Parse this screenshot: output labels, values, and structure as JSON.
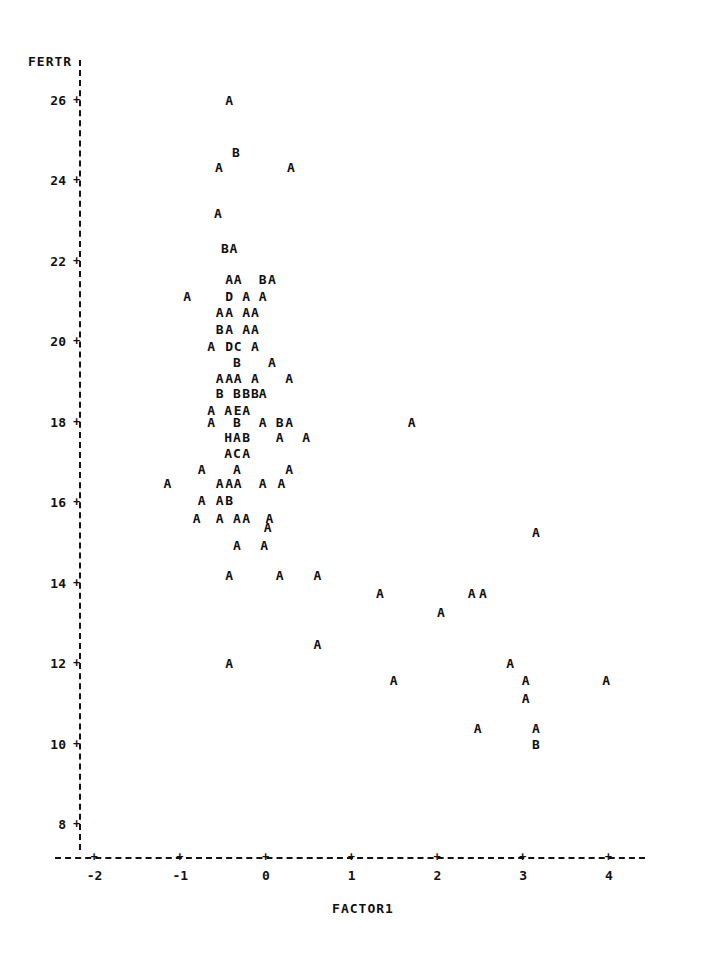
{
  "chart_data": {
    "type": "scatter",
    "title": "",
    "xlabel": "FACTOR1",
    "ylabel": "FERTR",
    "grid": false,
    "legend": null,
    "axis_style": "dashed-ascii",
    "tick_glyph": "+",
    "xlim": [
      -2.25,
      4.35
    ],
    "ylim": [
      7.3,
      26.9
    ],
    "xticks": [
      -2,
      -1,
      0,
      1,
      2,
      3,
      4
    ],
    "xtick_labels": [
      "-2",
      "-1",
      "0",
      "1",
      "2",
      "3",
      "4"
    ],
    "yticks": [
      26,
      24,
      22,
      20,
      18,
      16,
      14,
      12,
      10,
      8
    ],
    "ytick_labels": [
      "26",
      "24",
      "22",
      "20",
      "18",
      "16",
      "14",
      "12",
      "10",
      "8"
    ],
    "point_labels_meaning": "letter denotes count of overlapping observations: A=1, B=2, C=3, D=4, E=5, H=8",
    "points": [
      {
        "label": "A",
        "x": -0.43,
        "y": 26.0
      },
      {
        "label": "B",
        "x": -0.35,
        "y": 24.7
      },
      {
        "label": "A",
        "x": -0.55,
        "y": 24.33
      },
      {
        "label": "A",
        "x": 0.29,
        "y": 24.33
      },
      {
        "label": "A",
        "x": -0.56,
        "y": 23.17
      },
      {
        "label": "B",
        "x": -0.48,
        "y": 22.3
      },
      {
        "label": "A",
        "x": -0.38,
        "y": 22.3
      },
      {
        "label": "A",
        "x": -0.43,
        "y": 21.53
      },
      {
        "label": "A",
        "x": -0.33,
        "y": 21.53
      },
      {
        "label": "B",
        "x": -0.04,
        "y": 21.53
      },
      {
        "label": "A",
        "x": 0.07,
        "y": 21.53
      },
      {
        "label": "A",
        "x": -0.92,
        "y": 21.13
      },
      {
        "label": "D",
        "x": -0.43,
        "y": 21.13
      },
      {
        "label": "A",
        "x": -0.23,
        "y": 21.13
      },
      {
        "label": "A",
        "x": -0.04,
        "y": 21.13
      },
      {
        "label": "A",
        "x": -0.54,
        "y": 20.72
      },
      {
        "label": "A",
        "x": -0.43,
        "y": 20.72
      },
      {
        "label": "A",
        "x": -0.23,
        "y": 20.72
      },
      {
        "label": "A",
        "x": -0.13,
        "y": 20.72
      },
      {
        "label": "B",
        "x": -0.54,
        "y": 20.3
      },
      {
        "label": "A",
        "x": -0.43,
        "y": 20.3
      },
      {
        "label": "A",
        "x": -0.23,
        "y": 20.3
      },
      {
        "label": "A",
        "x": -0.13,
        "y": 20.3
      },
      {
        "label": "A",
        "x": -0.64,
        "y": 19.88
      },
      {
        "label": "D",
        "x": -0.43,
        "y": 19.88
      },
      {
        "label": "C",
        "x": -0.33,
        "y": 19.88
      },
      {
        "label": "A",
        "x": -0.13,
        "y": 19.88
      },
      {
        "label": "B",
        "x": -0.34,
        "y": 19.48
      },
      {
        "label": "A",
        "x": 0.07,
        "y": 19.48
      },
      {
        "label": "A",
        "x": -0.54,
        "y": 19.09
      },
      {
        "label": "A",
        "x": -0.43,
        "y": 19.09
      },
      {
        "label": "A",
        "x": -0.33,
        "y": 19.09
      },
      {
        "label": "A",
        "x": -0.13,
        "y": 19.09
      },
      {
        "label": "A",
        "x": 0.27,
        "y": 19.09
      },
      {
        "label": "B",
        "x": -0.54,
        "y": 18.7
      },
      {
        "label": "B",
        "x": -0.34,
        "y": 18.7
      },
      {
        "label": "B",
        "x": -0.23,
        "y": 18.7
      },
      {
        "label": "B",
        "x": -0.13,
        "y": 18.7
      },
      {
        "label": "A",
        "x": -0.04,
        "y": 18.7
      },
      {
        "label": "A",
        "x": -0.64,
        "y": 18.29
      },
      {
        "label": "A",
        "x": -0.44,
        "y": 18.29
      },
      {
        "label": "E",
        "x": -0.33,
        "y": 18.29
      },
      {
        "label": "A",
        "x": -0.23,
        "y": 18.29
      },
      {
        "label": "A",
        "x": -0.64,
        "y": 18.0
      },
      {
        "label": "B",
        "x": -0.34,
        "y": 18.0
      },
      {
        "label": "A",
        "x": -0.04,
        "y": 18.0
      },
      {
        "label": "B",
        "x": 0.16,
        "y": 18.0
      },
      {
        "label": "A",
        "x": 0.27,
        "y": 18.0
      },
      {
        "label": "A",
        "x": 1.7,
        "y": 18.0
      },
      {
        "label": "H",
        "x": -0.44,
        "y": 17.61
      },
      {
        "label": "A",
        "x": -0.34,
        "y": 17.61
      },
      {
        "label": "B",
        "x": -0.23,
        "y": 17.61
      },
      {
        "label": "A",
        "x": 0.16,
        "y": 17.61
      },
      {
        "label": "A",
        "x": 0.47,
        "y": 17.61
      },
      {
        "label": "A",
        "x": -0.44,
        "y": 17.22
      },
      {
        "label": "C",
        "x": -0.34,
        "y": 17.22
      },
      {
        "label": "A",
        "x": -0.23,
        "y": 17.22
      },
      {
        "label": "A",
        "x": -0.75,
        "y": 16.83
      },
      {
        "label": "A",
        "x": -0.34,
        "y": 16.83
      },
      {
        "label": "A",
        "x": 0.27,
        "y": 16.83
      },
      {
        "label": "A",
        "x": -1.15,
        "y": 16.46
      },
      {
        "label": "A",
        "x": -0.54,
        "y": 16.46
      },
      {
        "label": "A",
        "x": -0.43,
        "y": 16.46
      },
      {
        "label": "A",
        "x": -0.33,
        "y": 16.46
      },
      {
        "label": "A",
        "x": -0.04,
        "y": 16.46
      },
      {
        "label": "A",
        "x": 0.18,
        "y": 16.46
      },
      {
        "label": "A",
        "x": -0.75,
        "y": 16.05
      },
      {
        "label": "A",
        "x": -0.54,
        "y": 16.05
      },
      {
        "label": "B",
        "x": -0.43,
        "y": 16.05
      },
      {
        "label": "A",
        "x": -0.81,
        "y": 15.61
      },
      {
        "label": "A",
        "x": -0.54,
        "y": 15.61
      },
      {
        "label": "A",
        "x": -0.34,
        "y": 15.61
      },
      {
        "label": "A",
        "x": -0.23,
        "y": 15.61
      },
      {
        "label": "A",
        "x": 0.04,
        "y": 15.61
      },
      {
        "label": "A",
        "x": 0.02,
        "y": 15.39
      },
      {
        "label": "A",
        "x": -0.34,
        "y": 14.93
      },
      {
        "label": "A",
        "x": -0.02,
        "y": 14.93
      },
      {
        "label": "A",
        "x": 3.15,
        "y": 15.25
      },
      {
        "label": "A",
        "x": -0.43,
        "y": 14.19
      },
      {
        "label": "A",
        "x": 0.16,
        "y": 14.19
      },
      {
        "label": "A",
        "x": 0.6,
        "y": 14.19
      },
      {
        "label": "A",
        "x": 1.33,
        "y": 13.74
      },
      {
        "label": "A",
        "x": 2.04,
        "y": 13.26
      },
      {
        "label": "A",
        "x": 2.4,
        "y": 13.74
      },
      {
        "label": "A",
        "x": 2.53,
        "y": 13.74
      },
      {
        "label": "A",
        "x": 0.6,
        "y": 12.46
      },
      {
        "label": "A",
        "x": -0.43,
        "y": 12.0
      },
      {
        "label": "A",
        "x": 1.49,
        "y": 11.58
      },
      {
        "label": "A",
        "x": 2.85,
        "y": 12.0
      },
      {
        "label": "A",
        "x": 3.03,
        "y": 11.58
      },
      {
        "label": "A",
        "x": 3.97,
        "y": 11.58
      },
      {
        "label": "A",
        "x": 3.03,
        "y": 11.12
      },
      {
        "label": "A",
        "x": 2.47,
        "y": 10.38
      },
      {
        "label": "A",
        "x": 3.15,
        "y": 10.38
      },
      {
        "label": "B",
        "x": 3.15,
        "y": 10.0
      }
    ]
  }
}
